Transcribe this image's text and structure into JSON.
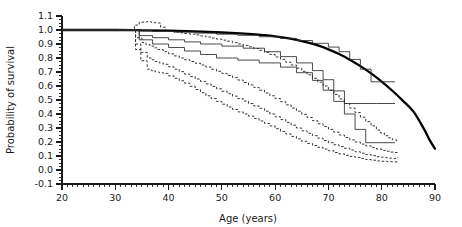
{
  "chart_data": {
    "type": "line",
    "title": "",
    "xlabel": "Age (years)",
    "ylabel": "Probability of survival",
    "xlim": [
      20,
      90
    ],
    "ylim": [
      -0.1,
      1.1
    ],
    "x_ticks": [
      20,
      30,
      40,
      50,
      60,
      70,
      80,
      90
    ],
    "x_tick_labels": [
      "20",
      "30",
      "40",
      "50",
      "60",
      "70",
      "80",
      "90"
    ],
    "x_minor_tick_step": 1,
    "y_ticks": [
      -0.1,
      0.0,
      0.1,
      0.2,
      0.3,
      0.4,
      0.5,
      0.6,
      0.7,
      0.8,
      0.9,
      1.0,
      1.1
    ],
    "y_tick_labels": [
      "-0.1",
      "0.0",
      "0.1",
      "0.2",
      "0.3",
      "0.4",
      "0.5",
      "0.6",
      "0.7",
      "0.8",
      "0.9",
      "1.0",
      "1.1"
    ],
    "y_minor_tick_step": 0.025,
    "grid": false,
    "legend": "none",
    "series": [
      {
        "name": "Reference population survival",
        "style": "solid-thick-smooth",
        "points": [
          [
            20,
            1.0
          ],
          [
            30,
            1.0
          ],
          [
            35,
            0.998
          ],
          [
            40,
            0.995
          ],
          [
            45,
            0.99
          ],
          [
            50,
            0.982
          ],
          [
            55,
            0.972
          ],
          [
            58,
            0.963
          ],
          [
            60,
            0.955
          ],
          [
            62,
            0.944
          ],
          [
            64,
            0.93
          ],
          [
            66,
            0.912
          ],
          [
            68,
            0.89
          ],
          [
            70,
            0.862
          ],
          [
            72,
            0.828
          ],
          [
            74,
            0.788
          ],
          [
            76,
            0.742
          ],
          [
            78,
            0.69
          ],
          [
            80,
            0.632
          ],
          [
            82,
            0.566
          ],
          [
            84,
            0.494
          ],
          [
            86,
            0.415
          ],
          [
            88,
            0.288
          ],
          [
            89,
            0.213
          ],
          [
            90,
            0.152
          ]
        ]
      },
      {
        "name": "Survival estimate group 1 (upper solid step)",
        "style": "solid-step",
        "points": [
          [
            20,
            1.0
          ],
          [
            33.5,
            1.0
          ],
          [
            34.2,
            0.995
          ],
          [
            36,
            0.995
          ],
          [
            37,
            0.99
          ],
          [
            40,
            0.99
          ],
          [
            41,
            0.985
          ],
          [
            44,
            0.985
          ],
          [
            45,
            0.978
          ],
          [
            48,
            0.978
          ],
          [
            49,
            0.97
          ],
          [
            52,
            0.97
          ],
          [
            53,
            0.962
          ],
          [
            56,
            0.962
          ],
          [
            57,
            0.952
          ],
          [
            60,
            0.952
          ],
          [
            61,
            0.94
          ],
          [
            63,
            0.94
          ],
          [
            64,
            0.925
          ],
          [
            66,
            0.925
          ],
          [
            67,
            0.905
          ],
          [
            69,
            0.905
          ],
          [
            70,
            0.878
          ],
          [
            71,
            0.878
          ],
          [
            72,
            0.845
          ],
          [
            73,
            0.845
          ],
          [
            74,
            0.79
          ],
          [
            75,
            0.79
          ],
          [
            76,
            0.72
          ],
          [
            77,
            0.72
          ],
          [
            78,
            0.63
          ],
          [
            82.5,
            0.63
          ]
        ]
      },
      {
        "name": "Survival estimate group 2 (middle solid step)",
        "style": "solid-step",
        "points": [
          [
            20,
            1.0
          ],
          [
            33.5,
            1.0
          ],
          [
            34.5,
            0.96
          ],
          [
            36,
            0.96
          ],
          [
            37,
            0.945
          ],
          [
            39,
            0.945
          ],
          [
            40,
            0.93
          ],
          [
            42,
            0.93
          ],
          [
            43,
            0.915
          ],
          [
            45,
            0.915
          ],
          [
            46,
            0.9
          ],
          [
            49,
            0.9
          ],
          [
            50,
            0.885
          ],
          [
            53,
            0.885
          ],
          [
            54,
            0.87
          ],
          [
            57,
            0.87
          ],
          [
            58,
            0.845
          ],
          [
            60,
            0.845
          ],
          [
            61,
            0.81
          ],
          [
            63,
            0.81
          ],
          [
            64,
            0.765
          ],
          [
            66,
            0.765
          ],
          [
            67,
            0.71
          ],
          [
            68,
            0.71
          ],
          [
            69,
            0.645
          ],
          [
            70,
            0.645
          ],
          [
            71,
            0.565
          ],
          [
            72,
            0.565
          ],
          [
            73,
            0.475
          ],
          [
            78,
            0.475
          ],
          [
            79,
            0.475
          ],
          [
            82.5,
            0.475
          ]
        ]
      },
      {
        "name": "Survival estimate group 3 (lower solid step)",
        "style": "solid-step",
        "points": [
          [
            20,
            1.0
          ],
          [
            33.5,
            1.0
          ],
          [
            34.5,
            0.93
          ],
          [
            36,
            0.93
          ],
          [
            37,
            0.9
          ],
          [
            39,
            0.9
          ],
          [
            40,
            0.875
          ],
          [
            42,
            0.875
          ],
          [
            43,
            0.85
          ],
          [
            45,
            0.85
          ],
          [
            46,
            0.825
          ],
          [
            48,
            0.825
          ],
          [
            49,
            0.8
          ],
          [
            52,
            0.8
          ],
          [
            53,
            0.785
          ],
          [
            56,
            0.785
          ],
          [
            57,
            0.765
          ],
          [
            60,
            0.765
          ],
          [
            61,
            0.735
          ],
          [
            63,
            0.735
          ],
          [
            64,
            0.695
          ],
          [
            66,
            0.695
          ],
          [
            67,
            0.64
          ],
          [
            68,
            0.64
          ],
          [
            69,
            0.57
          ],
          [
            70,
            0.57
          ],
          [
            71,
            0.49
          ],
          [
            72,
            0.49
          ],
          [
            73,
            0.4
          ],
          [
            74,
            0.4
          ],
          [
            75,
            0.29
          ],
          [
            76,
            0.29
          ],
          [
            77,
            0.195
          ],
          [
            82.5,
            0.195
          ]
        ]
      },
      {
        "name": "Confidence limit A (upper dashed)",
        "style": "dashed-step",
        "points": [
          [
            20,
            1.0
          ],
          [
            33.0,
            1.0
          ],
          [
            33.6,
            1.035
          ],
          [
            34.5,
            1.055
          ],
          [
            36,
            1.06
          ],
          [
            37.5,
            1.05
          ],
          [
            38.5,
            1.02
          ],
          [
            39.5,
            0.995
          ],
          [
            41,
            0.985
          ],
          [
            43,
            0.975
          ],
          [
            45,
            0.965
          ],
          [
            47,
            0.95
          ],
          [
            49,
            0.935
          ],
          [
            51,
            0.92
          ],
          [
            53,
            0.9
          ],
          [
            55,
            0.88
          ],
          [
            57,
            0.855
          ],
          [
            59,
            0.825
          ],
          [
            61,
            0.79
          ],
          [
            63,
            0.75
          ],
          [
            65,
            0.705
          ],
          [
            67,
            0.655
          ],
          [
            69,
            0.6
          ],
          [
            71,
            0.54
          ],
          [
            73,
            0.475
          ],
          [
            75,
            0.41
          ],
          [
            77,
            0.345
          ],
          [
            79,
            0.285
          ],
          [
            80.5,
            0.245
          ],
          [
            82,
            0.215
          ],
          [
            82.8,
            0.205
          ],
          [
            83,
            0.2
          ]
        ]
      },
      {
        "name": "Confidence limit B (middle dashed)",
        "style": "dashed-step",
        "points": [
          [
            20,
            1.0
          ],
          [
            33.0,
            1.0
          ],
          [
            33.8,
            0.945
          ],
          [
            35,
            0.91
          ],
          [
            36.5,
            0.885
          ],
          [
            38,
            0.86
          ],
          [
            40,
            0.83
          ],
          [
            42,
            0.8
          ],
          [
            44,
            0.775
          ],
          [
            46,
            0.75
          ],
          [
            48,
            0.72
          ],
          [
            50,
            0.69
          ],
          [
            52,
            0.66
          ],
          [
            54,
            0.625
          ],
          [
            56,
            0.59
          ],
          [
            58,
            0.55
          ],
          [
            60,
            0.51
          ],
          [
            62,
            0.465
          ],
          [
            64,
            0.42
          ],
          [
            66,
            0.375
          ],
          [
            68,
            0.33
          ],
          [
            70,
            0.29
          ],
          [
            72,
            0.25
          ],
          [
            74,
            0.215
          ],
          [
            76,
            0.185
          ],
          [
            78,
            0.16
          ],
          [
            80,
            0.14
          ],
          [
            81.5,
            0.128
          ],
          [
            82.5,
            0.125
          ],
          [
            83,
            0.13
          ]
        ]
      },
      {
        "name": "Confidence limit C (lower dashed)",
        "style": "dashed-step",
        "points": [
          [
            20,
            1.0
          ],
          [
            33.0,
            1.0
          ],
          [
            33.8,
            0.9
          ],
          [
            34.8,
            0.84
          ],
          [
            36,
            0.8
          ],
          [
            37.5,
            0.775
          ],
          [
            39,
            0.755
          ],
          [
            41,
            0.72
          ],
          [
            43,
            0.685
          ],
          [
            45,
            0.65
          ],
          [
            47,
            0.615
          ],
          [
            49,
            0.58
          ],
          [
            51,
            0.545
          ],
          [
            53,
            0.51
          ],
          [
            55,
            0.475
          ],
          [
            57,
            0.44
          ],
          [
            59,
            0.4
          ],
          [
            61,
            0.36
          ],
          [
            63,
            0.32
          ],
          [
            65,
            0.28
          ],
          [
            67,
            0.245
          ],
          [
            69,
            0.21
          ],
          [
            71,
            0.18
          ],
          [
            73,
            0.155
          ],
          [
            75,
            0.13
          ],
          [
            77,
            0.11
          ],
          [
            79,
            0.095
          ],
          [
            81,
            0.085
          ],
          [
            82.5,
            0.082
          ],
          [
            83,
            0.09
          ]
        ]
      },
      {
        "name": "Confidence limit D (lowest dashed)",
        "style": "dashed-step",
        "points": [
          [
            20,
            1.0
          ],
          [
            33.0,
            1.0
          ],
          [
            33.8,
            0.86
          ],
          [
            34.8,
            0.78
          ],
          [
            36,
            0.72
          ],
          [
            37.5,
            0.7
          ],
          [
            39,
            0.69
          ],
          [
            41,
            0.655
          ],
          [
            43,
            0.62
          ],
          [
            45,
            0.575
          ],
          [
            47,
            0.53
          ],
          [
            49,
            0.49
          ],
          [
            51,
            0.45
          ],
          [
            53,
            0.415
          ],
          [
            55,
            0.385
          ],
          [
            57,
            0.35
          ],
          [
            59,
            0.315
          ],
          [
            61,
            0.275
          ],
          [
            63,
            0.24
          ],
          [
            65,
            0.205
          ],
          [
            67,
            0.175
          ],
          [
            69,
            0.15
          ],
          [
            71,
            0.125
          ],
          [
            73,
            0.105
          ],
          [
            75,
            0.09
          ],
          [
            77,
            0.075
          ],
          [
            79,
            0.065
          ],
          [
            81,
            0.06
          ],
          [
            82.5,
            0.058
          ],
          [
            83,
            0.065
          ]
        ]
      }
    ]
  },
  "axes": {
    "x_title": "Age (years)",
    "y_title": "Probability of survival"
  },
  "colors": {
    "axis": "#1a1a1a",
    "curve": "#2b2b2b",
    "reference": "#000000",
    "background": "#ffffff"
  }
}
